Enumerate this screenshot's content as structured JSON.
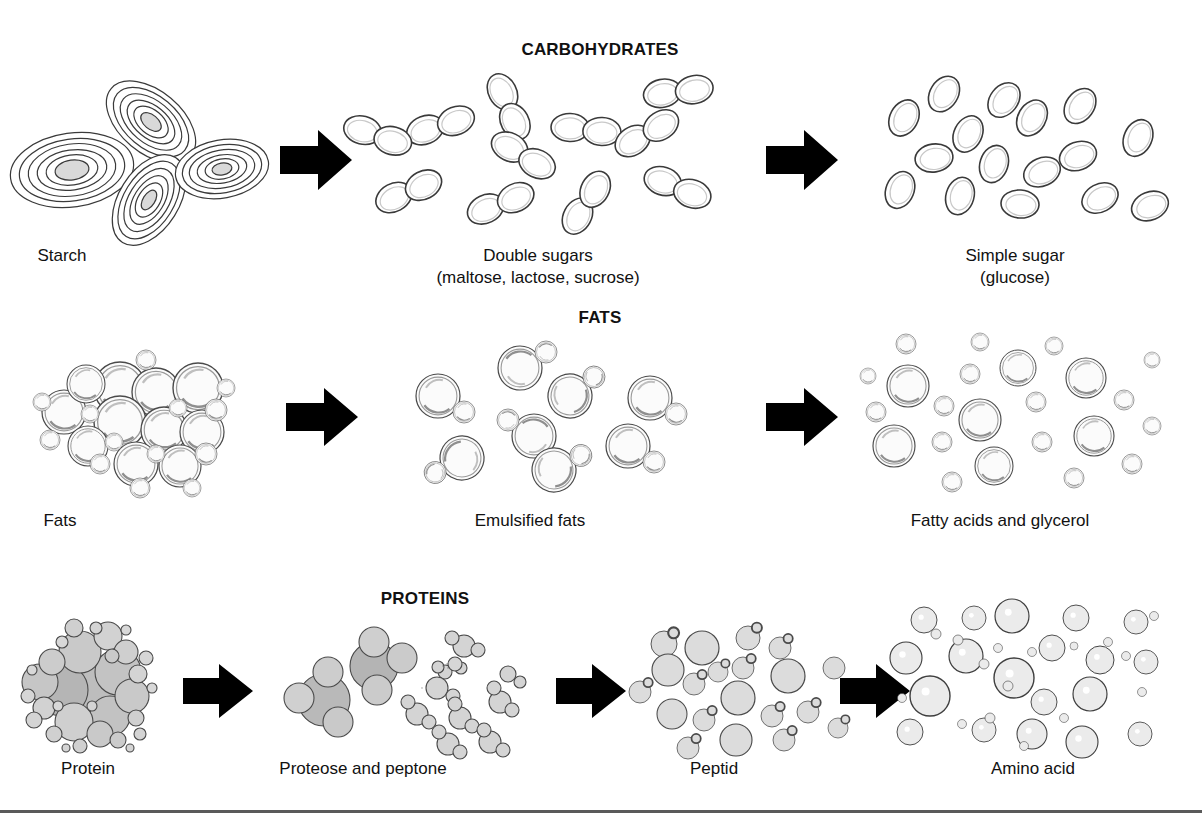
{
  "figure": {
    "title_carbs": "CARBOHYDRATES",
    "title_fats": "FATS",
    "title_proteins": "PROTEINS",
    "background_color": "#ffffff",
    "line_color": "#333333",
    "arrow_color": "#000000",
    "rule_color": "#5a5a5a"
  },
  "rows": [
    {
      "name": "carbohydrates",
      "heading": "CARBOHYDRATES",
      "stages": [
        {
          "label": "Starch",
          "sublabel": "",
          "particle": "starch-granule-contours",
          "count": 4
        },
        {
          "label": "Double sugars",
          "sublabel": "(maltose, lactose, sucrose)",
          "particle": "paired-oval-sugar",
          "count": 11
        },
        {
          "label": "Simple sugar",
          "sublabel": "(glucose)",
          "particle": "single-oval-sugar",
          "count": 16
        }
      ],
      "arrows": 2
    },
    {
      "name": "fats",
      "heading": "FATS",
      "stages": [
        {
          "label": "Fats",
          "sublabel": "",
          "particle": "clustered-fat-globule",
          "count": 24
        },
        {
          "label": "Emulsified fats",
          "sublabel": "",
          "particle": "emulsified-globule-pair",
          "count": 8
        },
        {
          "label": "Fatty acids and glycerol",
          "sublabel": "",
          "particle": "separate-fat-droplet",
          "count": 23
        }
      ],
      "arrows": 2
    },
    {
      "name": "proteins",
      "heading": "PROTEINS",
      "stages": [
        {
          "label": "Protein",
          "sublabel": "",
          "particle": "dense-gray-protein-cluster",
          "count": 33
        },
        {
          "label": "Proteose and peptone",
          "sublabel": "",
          "particle": "protein-fragment-cluster",
          "count": 13
        },
        {
          "label": "Peptid",
          "sublabel": "",
          "particle": "peptide-circle-with-bud",
          "count": 20
        },
        {
          "label": "Amino acid",
          "sublabel": "",
          "particle": "single-amino-acid-circle",
          "count": 34
        }
      ],
      "arrows": 3
    }
  ]
}
